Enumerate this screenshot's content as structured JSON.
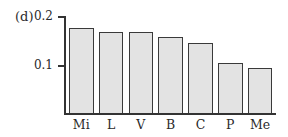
{
  "panel_label": "(d)",
  "chart_data": {
    "type": "bar",
    "title": "",
    "xlabel": "",
    "ylabel": "",
    "categories": [
      "Mi",
      "L",
      "V",
      "B",
      "C",
      "P",
      "Me"
    ],
    "values": [
      0.178,
      0.169,
      0.169,
      0.159,
      0.147,
      0.106,
      0.096
    ],
    "yticks": [
      "0.1",
      "0.2"
    ],
    "ylim": [
      0,
      0.2
    ],
    "grid": false,
    "legend": null,
    "bar_fill": "#e3e3e3",
    "bar_edge": "#3a3a3a"
  }
}
